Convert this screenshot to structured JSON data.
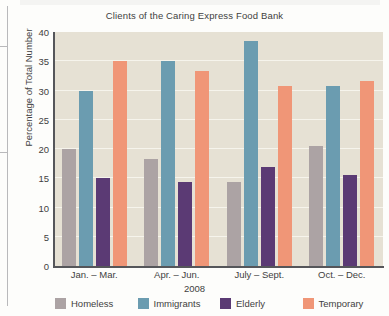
{
  "chart_data": {
    "type": "bar",
    "title": "Clients of the Caring Express Food Bank",
    "xlabel": "2008",
    "ylabel": "Percentage of Total Number",
    "categories": [
      "Jan. – Mar.",
      "Apr. – Jun.",
      "July – Sept.",
      "Oct. – Dec."
    ],
    "series": [
      {
        "name": "Homeless",
        "color": "#aca3a4",
        "values": [
          20.0,
          18.3,
          14.3,
          20.5
        ]
      },
      {
        "name": "Immigrants",
        "color": "#6b9cb0",
        "values": [
          30.0,
          35.0,
          38.5,
          30.7
        ]
      },
      {
        "name": "Elderly",
        "color": "#5b3a74",
        "values": [
          15.0,
          14.3,
          17.0,
          15.6
        ]
      },
      {
        "name": "Temporary",
        "color": "#f09677",
        "values": [
          35.0,
          33.3,
          30.7,
          31.7
        ]
      }
    ],
    "ylim": [
      0,
      40
    ],
    "yticks": [
      0,
      5,
      10,
      15,
      20,
      25,
      30,
      35,
      40
    ],
    "ytick_labels": [
      "0",
      "5",
      "10",
      "15",
      "20",
      "25",
      "30",
      "35",
      "40"
    ],
    "grid": true,
    "grid_color": "#f6f4ec",
    "plot_background": "#e6e1d4",
    "legend_position": "bottom",
    "axis_color": "#55565a"
  }
}
